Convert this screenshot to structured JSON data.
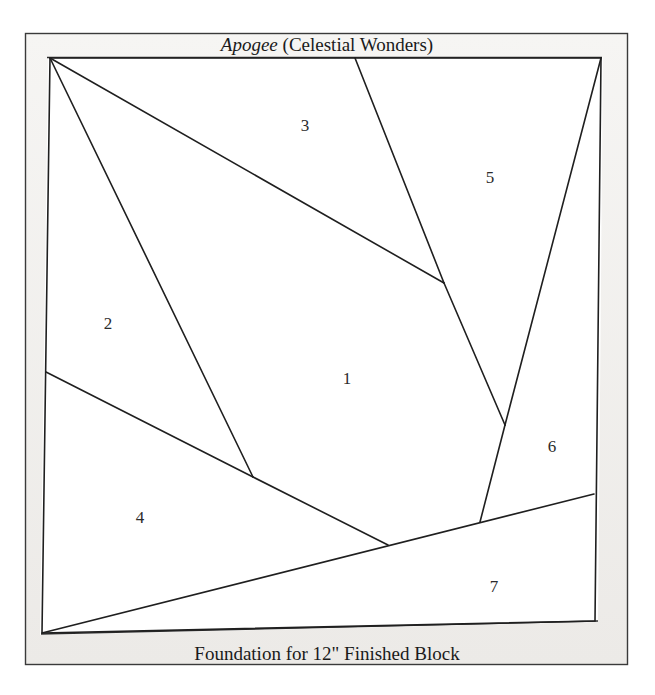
{
  "page": {
    "background_color": "#ffffff",
    "width": 655,
    "height": 695
  },
  "pattern": {
    "title_italic": "Apogee",
    "title_rest": " (Celestial Wonders)",
    "title_full": "Apogee (Celestial Wonders)",
    "footer_caption": "Foundation for 12\" Finished Block",
    "frame": {
      "border_color": "#3a3a3a",
      "fill_color": "#f2f1ef",
      "outer": {
        "x": 25,
        "y": 33,
        "width": 603,
        "height": 632
      },
      "inner": {
        "x": 46,
        "y": 57,
        "width": 551,
        "height": 577
      }
    },
    "line_color": "#1f1f1f",
    "line_width": 1.6,
    "pieces": [
      {
        "label": "1",
        "x": 347,
        "y": 380
      },
      {
        "label": "2",
        "x": 108,
        "y": 325
      },
      {
        "label": "3",
        "x": 305,
        "y": 127
      },
      {
        "label": "4",
        "x": 140,
        "y": 519
      },
      {
        "label": "5",
        "x": 490,
        "y": 179
      },
      {
        "label": "6",
        "x": 552,
        "y": 448
      },
      {
        "label": "7",
        "x": 494,
        "y": 588
      }
    ],
    "seam_lines": [
      {
        "name": "seam-topleft-to-vertex-283",
        "x1": 50,
        "y1": 58,
        "x2": 444,
        "y2": 283
      },
      {
        "name": "seam-topedge-to-vertex-283",
        "x1": 355,
        "y1": 58,
        "x2": 444,
        "y2": 283
      },
      {
        "name": "seam-vertex283-to-apex425",
        "x1": 444,
        "y1": 283,
        "x2": 505,
        "y2": 425
      },
      {
        "name": "seam-apex425-to-baseline",
        "x1": 505,
        "y1": 425,
        "x2": 480,
        "y2": 522
      },
      {
        "name": "seam-topright-to-apex425",
        "x1": 601,
        "y1": 58,
        "x2": 505,
        "y2": 425
      },
      {
        "name": "seam-topleft-to-vertex477",
        "x1": 50,
        "y1": 58,
        "x2": 253,
        "y2": 477
      },
      {
        "name": "seam-leftedge-to-vertex477",
        "x1": 46,
        "y1": 372,
        "x2": 253,
        "y2": 477
      },
      {
        "name": "seam-vertex477-to-vertex545",
        "x1": 253,
        "y1": 477,
        "x2": 388,
        "y2": 545
      },
      {
        "name": "seam-bottomleft-long-diagonal",
        "x1": 42,
        "y1": 633,
        "x2": 594,
        "y2": 494
      }
    ],
    "inner_outline": {
      "name": "block-outline",
      "points": "50,58 601,58 595,621 42,633"
    }
  }
}
